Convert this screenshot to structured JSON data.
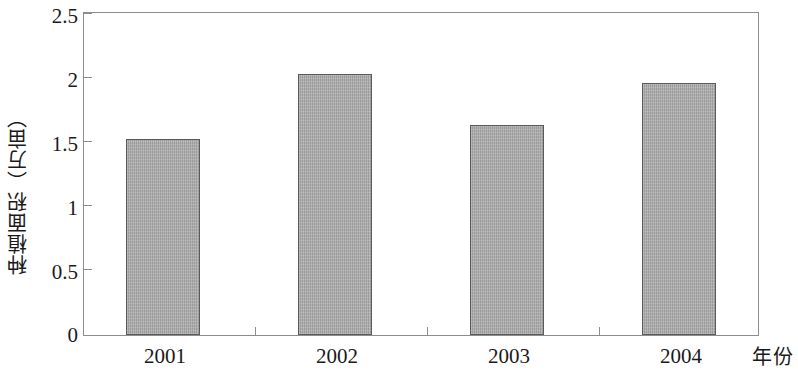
{
  "chart_data": {
    "type": "bar",
    "title": "",
    "subtitle": "",
    "xlabel": "年份",
    "ylabel": "种植面积（万亩）",
    "categories": [
      "2001",
      "2002",
      "2003",
      "2004"
    ],
    "values": [
      1.52,
      2.03,
      1.63,
      1.96
    ],
    "series": [
      {
        "name": "种植面积",
        "values": [
          1.52,
          2.03,
          1.63,
          1.96
        ]
      }
    ],
    "ylim": [
      0,
      2.5
    ],
    "ytick_labels": [
      "2.5",
      "2",
      "1.5",
      "1",
      "0.5",
      "0"
    ],
    "ytick_values": [
      2.5,
      2,
      1.5,
      1,
      0.5,
      0
    ],
    "ytick_step": 0.5,
    "grid": false,
    "legend": false,
    "legend_position": "none",
    "bar_fill_color": "#a9a9a9",
    "bar_border_color": "#5a5a5a",
    "axis_color": "#8d8d8d",
    "background_color": "#ffffff",
    "text_color": "#1a1a1a"
  }
}
